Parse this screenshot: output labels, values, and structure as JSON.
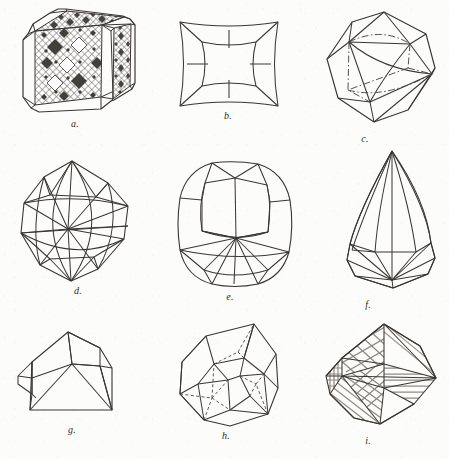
{
  "plate": {
    "title": "Crystal forms plate",
    "background_color": "#fcfcfa",
    "ink_color": "#3a3733",
    "hatch_color": "#55514b",
    "faint_ink_color": "#9b9790",
    "width": 449,
    "height": 459
  },
  "figures": [
    {
      "id": "a",
      "caption": "a.",
      "name": "beveled-cube-with-patterned-faces",
      "description": "Cube with beveled edges and corners; front, top and right faces filled with a diagonal cross-hatch and rows of dark lozenge (diamond) etch figures.",
      "row": 1,
      "column": 1,
      "shaded": true,
      "dashed_hidden_edges": false
    },
    {
      "id": "b",
      "caption": "b.",
      "name": "hollow-square-hopper-crystal",
      "description": "Square hopper crystal: outer square outline with concave sides and a large open square cavity in the centre, sloping walls drawn to the corners.",
      "row": 1,
      "column": 2,
      "shaded": false,
      "dashed_hidden_edges": false
    },
    {
      "id": "c",
      "caption": "c.",
      "name": "octahedron-with-dashed-hidden-edges",
      "description": "Octahedron-like solid viewed on a vertex, with the rear square girdle of edges rendered as dash-dot hidden lines.",
      "row": 1,
      "column": 3,
      "shaded": false,
      "dashed_hidden_edges": true
    },
    {
      "id": "d",
      "caption": "d.",
      "name": "rounded-octahedron-trisoctahedron",
      "description": "Many-faced rounded octahedral form (trisoctahedron); curved girdle arcs cross a central point, triangular facets radiate to top and bottom apices.",
      "row": 2,
      "column": 1,
      "shaded": false,
      "dashed_hidden_edges": false
    },
    {
      "id": "e",
      "caption": "e.",
      "name": "cushion-cut-barrel-crystal",
      "description": "Tall cushion-shaped barrel crystal with rounded corners, vertical prism faces and a star of facets converging at the lower centre point.",
      "row": 2,
      "column": 2,
      "shaded": false,
      "dashed_hidden_edges": false
    },
    {
      "id": "f",
      "caption": "f.",
      "name": "elongated-pointed-teardrop-crystal",
      "description": "Steeply pointed teardrop / flame-shaped crystal, long curved faces sweeping from a single apex down to a low faceted base.",
      "row": 2,
      "column": 3,
      "shaded": false,
      "dashed_hidden_edges": false
    },
    {
      "id": "g",
      "caption": "g.",
      "name": "wedge-block-crystal",
      "description": "Blocky wedge-shaped crystal: a slanted roof plane over a prism body with a projecting flange on the left side.",
      "row": 3,
      "column": 1,
      "shaded": false,
      "dashed_hidden_edges": false
    },
    {
      "id": "h",
      "caption": "h.",
      "name": "complex-polyhedron-with-hidden-edges",
      "description": "Complex multi-faced polyhedron with pentagonal facets; the rear edges are drawn as fine dashed hidden lines.",
      "row": 3,
      "column": 2,
      "shaded": false,
      "dashed_hidden_edges": true
    },
    {
      "id": "i",
      "caption": "i.",
      "name": "octahedron-with-striated-faces",
      "description": "Octahedral crystal whose faces carry dense parallel striations: diagonal striae on upper-left and lower faces and horizontal striae on the right face.",
      "row": 3,
      "column": 3,
      "shaded": false,
      "striated": true,
      "dashed_hidden_edges": false
    }
  ]
}
